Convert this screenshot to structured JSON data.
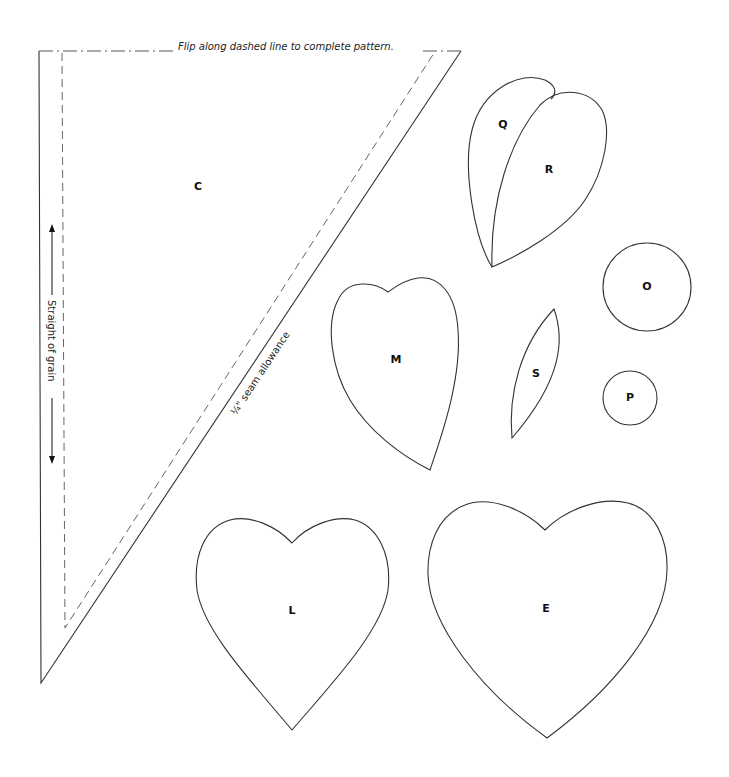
{
  "pattern": {
    "flip_note": "Flip along dashed line to complete pattern.",
    "grain_label": "Straight of grain",
    "seam_label": "¼\" seam allowance",
    "pieces": {
      "C": "C",
      "Q": "Q",
      "R": "R",
      "M": "M",
      "S": "S",
      "O": "O",
      "P": "P",
      "L": "L",
      "E": "E"
    }
  }
}
